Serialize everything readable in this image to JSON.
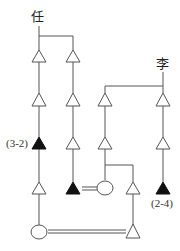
{
  "diagram": {
    "type": "kinship-genealogy",
    "colors": {
      "line": "#555555",
      "filled_node": "#111111",
      "open_node": "#ffffff"
    },
    "families": [
      {
        "name": "任",
        "label_position": "top-left"
      },
      {
        "name": "李",
        "label_position": "top-right"
      }
    ],
    "labels": {
      "family_left": "任",
      "family_right": "李",
      "marker_left": "(3-2)",
      "marker_right": "(2-4)"
    },
    "legend": {
      "open-triangle": "male",
      "filled-triangle": "male (highlighted individual)",
      "open-circle": "female",
      "double-line": "marriage"
    },
    "nodes": [
      {
        "id": "R1a",
        "family": "任",
        "shape": "triangle",
        "filled": false,
        "col": 1,
        "row": 1
      },
      {
        "id": "R1b",
        "family": "任",
        "shape": "triangle",
        "filled": false,
        "col": 2,
        "row": 1
      },
      {
        "id": "R2a",
        "family": "任",
        "shape": "triangle",
        "filled": false,
        "col": 1,
        "row": 2
      },
      {
        "id": "R2b",
        "family": "任",
        "shape": "triangle",
        "filled": false,
        "col": 2,
        "row": 2
      },
      {
        "id": "R3a",
        "family": "任",
        "shape": "triangle",
        "filled": true,
        "col": 1,
        "row": 3,
        "label": "(3-2)"
      },
      {
        "id": "R3b",
        "family": "任",
        "shape": "triangle",
        "filled": false,
        "col": 2,
        "row": 3
      },
      {
        "id": "R4a",
        "family": "任",
        "shape": "triangle",
        "filled": false,
        "col": 1,
        "row": 4
      },
      {
        "id": "R4b",
        "family": "任",
        "shape": "triangle",
        "filled": true,
        "col": 2,
        "row": 4
      },
      {
        "id": "R5a",
        "family": "任",
        "shape": "circle",
        "filled": false,
        "col": 1,
        "row": 5
      },
      {
        "id": "L2a",
        "family": "李",
        "shape": "triangle",
        "filled": false,
        "col": 3,
        "row": 2
      },
      {
        "id": "L2b",
        "family": "李",
        "shape": "triangle",
        "filled": false,
        "col": 5,
        "row": 2
      },
      {
        "id": "L3a",
        "family": "李",
        "shape": "triangle",
        "filled": false,
        "col": 3,
        "row": 3
      },
      {
        "id": "L3b",
        "family": "李",
        "shape": "triangle",
        "filled": false,
        "col": 5,
        "row": 3
      },
      {
        "id": "L4a",
        "family": "李",
        "shape": "circle",
        "filled": false,
        "col": 3,
        "row": 4
      },
      {
        "id": "L4c",
        "family": "李",
        "shape": "triangle",
        "filled": false,
        "col": 4,
        "row": 4
      },
      {
        "id": "L4b",
        "family": "李",
        "shape": "triangle",
        "filled": true,
        "col": 5,
        "row": 4,
        "label": "(2-4)"
      },
      {
        "id": "L5",
        "family": "李",
        "shape": "triangle",
        "filled": false,
        "col": 4,
        "row": 5
      }
    ],
    "marriages": [
      {
        "a": "R4b",
        "b": "L4a"
      },
      {
        "a": "R5a",
        "b": "L5"
      }
    ]
  }
}
